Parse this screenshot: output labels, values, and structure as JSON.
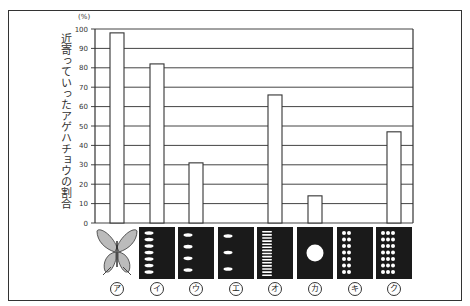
{
  "chart_data": {
    "type": "bar",
    "title": "",
    "ylabel": "近寄っていったアゲハチョウの割合",
    "yunit": "(%)",
    "xlabel": "",
    "ylim": [
      0,
      100
    ],
    "yticks": [
      0,
      10,
      20,
      30,
      40,
      50,
      60,
      70,
      80,
      90,
      100
    ],
    "grid": true,
    "categories": [
      "ア",
      "イ",
      "ウ",
      "エ",
      "オ",
      "カ",
      "キ",
      "ク"
    ],
    "values": [
      98,
      82,
      31,
      0,
      66,
      14,
      0,
      47
    ],
    "category_images": [
      "butterfly illustration",
      "black card with 7 white horizontal dashes in a column",
      "black card with 4 white horizontal dashes in a column",
      "black card with 3 white horizontal dashes in a column",
      "black card with many thin white horizontal stripes in a column",
      "black card with one large white circle",
      "black card with 2 columns of white dots (7 rows)",
      "black card with 3 columns of white dots (7 rows)"
    ]
  },
  "labels": {
    "unit": "(%)",
    "ylabel": "近寄っていったアゲハチョウの割合",
    "ticks": [
      "0",
      "10",
      "20",
      "30",
      "40",
      "50",
      "60",
      "70",
      "80",
      "90",
      "100"
    ],
    "categories": [
      "ア",
      "イ",
      "ウ",
      "エ",
      "オ",
      "カ",
      "キ",
      "ク"
    ]
  },
  "colors": {
    "bar_fill": "#ffffff",
    "line": "#333333",
    "card": "#1a1a1a",
    "mark": "#ffffff"
  }
}
